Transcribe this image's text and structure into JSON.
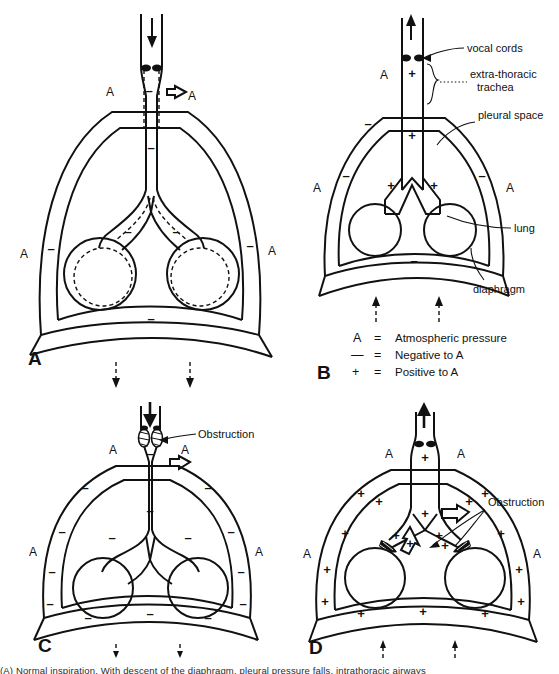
{
  "figure": {
    "kind": "medical-illustration",
    "panel_count": 4,
    "caption_fragment": "(A) Normal inspiration. With descent of the diaphragm, pleural pressure falls, intrathoracic airways"
  },
  "legend": {
    "rows": [
      {
        "symbol": "A",
        "equals": "=",
        "meaning": "Atmospheric pressure"
      },
      {
        "symbol": "—",
        "equals": "=",
        "meaning": "Negative to A"
      },
      {
        "symbol": "+",
        "equals": "=",
        "meaning": "Positive to A"
      }
    ]
  },
  "panels": [
    {
      "id": "A",
      "letter": "A",
      "phase": "inspiration",
      "flow_direction": "in",
      "pressure_sign": "negative",
      "atmosphere_labels": [
        "A",
        "A",
        "A",
        "A"
      ],
      "pressure_marks": [
        "–",
        "–",
        "–",
        "–",
        "–",
        "–",
        "–",
        "–"
      ],
      "diaphragm_arrows": "down-dashed",
      "shows_dashed_resting_outline": true,
      "callouts": []
    },
    {
      "id": "B",
      "letter": "B",
      "phase": "expiration",
      "flow_direction": "out",
      "pressure_sign": "positive-airway",
      "atmosphere_labels": [
        "A",
        "A",
        "A"
      ],
      "pressure_marks_airway": [
        "+",
        "+",
        "+",
        "+"
      ],
      "pressure_marks_pleural": [
        "–",
        "–",
        "–",
        "–",
        "–"
      ],
      "diaphragm_arrows": "up-dashed",
      "shows_dashed_resting_outline": false,
      "callouts": [
        {
          "text": "vocal cords",
          "target": "vocal-cords"
        },
        {
          "text": "extra-thoracic trachea",
          "target": "extra-thoracic-trachea"
        },
        {
          "text": "pleural space",
          "target": "pleural-space"
        },
        {
          "text": "lung",
          "target": "lung"
        },
        {
          "text": "diaphragm",
          "target": "diaphragm"
        }
      ]
    },
    {
      "id": "C",
      "letter": "C",
      "phase": "inspiration",
      "flow_direction": "in",
      "pressure_sign": "negative",
      "atmosphere_labels": [
        "A",
        "A",
        "A",
        "A"
      ],
      "pressure_marks": [
        "–",
        "–",
        "–",
        "–",
        "–",
        "–",
        "–",
        "–",
        "–",
        "–",
        "–",
        "–",
        "–",
        "–",
        "–"
      ],
      "diaphragm_arrows": "down-dashed",
      "shows_dashed_resting_outline": false,
      "callouts": [
        {
          "text": "Obstruction",
          "target": "extrathoracic-obstruction"
        }
      ]
    },
    {
      "id": "D",
      "letter": "D",
      "phase": "expiration",
      "flow_direction": "out",
      "pressure_sign": "positive",
      "atmosphere_labels": [
        "A",
        "A",
        "A",
        "A"
      ],
      "pressure_marks": [
        "+",
        "+",
        "+",
        "+",
        "+",
        "+",
        "+",
        "+",
        "+",
        "+",
        "+",
        "+",
        "+",
        "+",
        "+",
        "+",
        "+",
        "+",
        "+",
        "+"
      ],
      "diaphragm_arrows": "up-dashed",
      "shows_dashed_resting_outline": false,
      "callouts": [
        {
          "text": "Obstruction",
          "target": "intrathoracic-obstruction"
        }
      ]
    }
  ],
  "colors": {
    "ink": "#111111",
    "paper": "#ffffff"
  }
}
